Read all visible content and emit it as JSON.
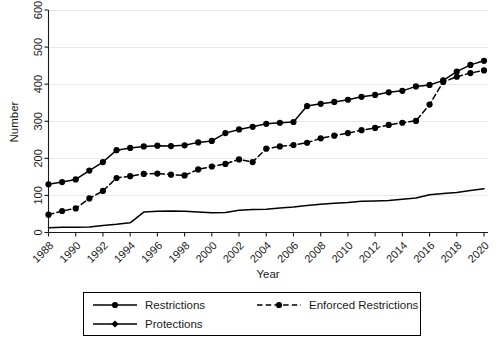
{
  "chart_data": {
    "type": "line",
    "title": "",
    "xlabel": "Year",
    "ylabel": "Number",
    "xlim": [
      1988,
      2020
    ],
    "ylim": [
      0,
      600
    ],
    "yticks": [
      0,
      100,
      200,
      300,
      400,
      500,
      600
    ],
    "xticks": [
      1988,
      1990,
      1992,
      1994,
      1996,
      1998,
      2000,
      2002,
      2004,
      2006,
      2008,
      2010,
      2012,
      2014,
      2016,
      2018,
      2020
    ],
    "xtick_labels": [
      "1988",
      "1990",
      "1992",
      "1994",
      "1996",
      "1998",
      "2000",
      "2002",
      "2004",
      "2006",
      "2008",
      "2010",
      "2012",
      "2014",
      "2016",
      "2018",
      "2020"
    ],
    "ytick_labels": [
      "0",
      "100",
      "200",
      "300",
      "400",
      "500",
      "600"
    ],
    "grid": "horizontal",
    "legend_position": "below-center",
    "x": [
      1988,
      1989,
      1990,
      1991,
      1992,
      1993,
      1994,
      1995,
      1996,
      1997,
      1998,
      1999,
      2000,
      2001,
      2002,
      2003,
      2004,
      2005,
      2006,
      2007,
      2008,
      2009,
      2010,
      2011,
      2012,
      2013,
      2014,
      2015,
      2016,
      2017,
      2018,
      2019,
      2020
    ],
    "series": [
      {
        "name": "Restrictions",
        "style": "solid",
        "marker": "circle",
        "color": "#000000",
        "values": [
          130,
          136,
          143,
          167,
          190,
          222,
          228,
          232,
          234,
          233,
          235,
          243,
          247,
          268,
          278,
          285,
          293,
          296,
          298,
          341,
          347,
          352,
          358,
          366,
          371,
          378,
          382,
          394,
          398,
          410,
          434,
          452,
          463
        ]
      },
      {
        "name": "Enforced Restrictions",
        "style": "dashed",
        "marker": "circle",
        "color": "#000000",
        "values": [
          48,
          58,
          65,
          92,
          112,
          147,
          152,
          158,
          159,
          156,
          154,
          170,
          178,
          185,
          197,
          190,
          226,
          232,
          236,
          242,
          254,
          261,
          268,
          276,
          282,
          290,
          296,
          301,
          345,
          406,
          420,
          430,
          437
        ]
      },
      {
        "name": "Protections",
        "style": "solid",
        "marker": "diamond",
        "color": "#000000",
        "values": [
          13,
          14,
          14,
          15,
          19,
          22,
          26,
          55,
          57,
          58,
          57,
          55,
          53,
          54,
          60,
          62,
          63,
          66,
          69,
          73,
          76,
          79,
          81,
          84,
          85,
          86,
          90,
          93,
          102,
          105,
          108,
          113,
          118
        ]
      }
    ]
  },
  "axes": {
    "x_title": "Year",
    "y_title": "Number"
  },
  "legend": {
    "entries": [
      {
        "label": "Restrictions",
        "style": "solid",
        "marker": "circle"
      },
      {
        "label": "Enforced Restrictions",
        "style": "dashed",
        "marker": "circle"
      },
      {
        "label": "Protections",
        "style": "solid",
        "marker": "diamond"
      }
    ]
  }
}
